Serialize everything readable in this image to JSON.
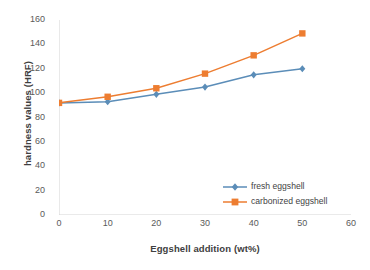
{
  "chart_data": {
    "type": "line",
    "title": "",
    "xlabel": "Eggshell addition (wt%)",
    "ylabel": "hardness values (HRF)",
    "x": [
      0,
      10,
      20,
      30,
      40,
      50
    ],
    "xlim": [
      0,
      60
    ],
    "ylim": [
      0,
      160
    ],
    "xticks": [
      0,
      10,
      20,
      30,
      40,
      50,
      60
    ],
    "yticks": [
      0,
      20,
      40,
      60,
      80,
      100,
      120,
      140,
      160
    ],
    "grid": false,
    "legend_position": "inside-bottom-right",
    "series": [
      {
        "name": "fresh eggshell",
        "values": [
          92,
          93,
          99,
          105,
          115,
          120
        ],
        "color": "#5B8DB8",
        "marker": "diamond"
      },
      {
        "name": "carbonized eggshell",
        "values": [
          92,
          97,
          104,
          116,
          131,
          149
        ],
        "color": "#ED7D31",
        "marker": "square"
      }
    ]
  },
  "axes": {
    "y_tick_labels": [
      "160",
      "140",
      "120",
      "100",
      "80",
      "60",
      "40",
      "20",
      "0"
    ],
    "x_tick_labels": [
      "0",
      "10",
      "20",
      "30",
      "40",
      "50",
      "60"
    ]
  },
  "legend": {
    "items": [
      {
        "label": "fresh eggshell",
        "color": "#5B8DB8"
      },
      {
        "label": "carbonized eggshell",
        "color": "#ED7D31"
      }
    ]
  }
}
